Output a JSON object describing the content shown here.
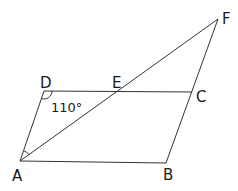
{
  "diagram": {
    "type": "geometry",
    "points": {
      "A": {
        "label": "A",
        "x": 20,
        "y": 161
      },
      "B": {
        "label": "B",
        "x": 166,
        "y": 163
      },
      "C": {
        "label": "C",
        "x": 192,
        "y": 92
      },
      "D": {
        "label": "D",
        "x": 44,
        "y": 91
      },
      "E": {
        "label": "E",
        "x": 118,
        "y": 91
      },
      "F": {
        "label": "F",
        "x": 218,
        "y": 19
      }
    },
    "segments": [
      "AB",
      "BF",
      "DC",
      "AD",
      "AF"
    ],
    "angle_labels": {
      "ADC": "110°"
    },
    "angle_markers": [
      "D",
      "A"
    ],
    "colors": {
      "line": "#333333",
      "text": "#1a1a1a",
      "background": "#ffffff"
    }
  }
}
